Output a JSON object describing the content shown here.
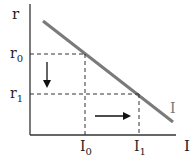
{
  "diagram": {
    "type": "investment-interest-rate-graph",
    "y_axis": {
      "label": "r",
      "ticks": [
        {
          "label": "r",
          "sub": "0"
        },
        {
          "label": "r",
          "sub": "1"
        }
      ]
    },
    "x_axis": {
      "label": "I",
      "ticks": [
        {
          "label": "I",
          "sub": "0"
        },
        {
          "label": "I",
          "sub": "1"
        }
      ]
    },
    "curve": {
      "label": "I",
      "color": "#7a7a7a"
    },
    "arrows": [
      {
        "direction": "down",
        "meaning": "interest rate falls from r0 to r1"
      },
      {
        "direction": "right",
        "meaning": "investment rises from I0 to I1"
      }
    ],
    "colors": {
      "axis": "#333333",
      "curve": "#7a7a7a",
      "dashed": "#333333",
      "arrow": "#111111"
    }
  }
}
